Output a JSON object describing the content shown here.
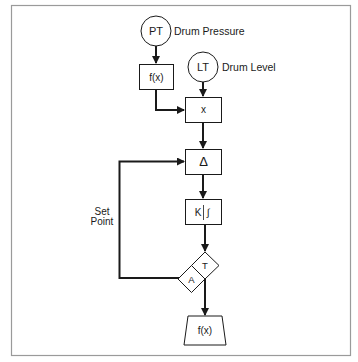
{
  "diagram": {
    "type": "control-loop-block-diagram",
    "nodes": {
      "pt": {
        "tag": "PT",
        "label": "Drum Pressure"
      },
      "lt": {
        "tag": "LT",
        "label": "Drum Level"
      },
      "fx_top": {
        "text": "f(x)"
      },
      "multiply": {
        "text": "x"
      },
      "delta": {
        "text": "Δ"
      },
      "integral": {
        "k": "K",
        "symbol": "∫"
      },
      "transfer": {
        "t": "T",
        "a": "A"
      },
      "fx_bottom": {
        "text": "f(x)"
      }
    },
    "set_point": {
      "line1": "Set",
      "line2": "Point"
    },
    "colors": {
      "stroke": "#1a1a1a",
      "frame": "#9a9a9a",
      "background": "#ffffff"
    }
  }
}
